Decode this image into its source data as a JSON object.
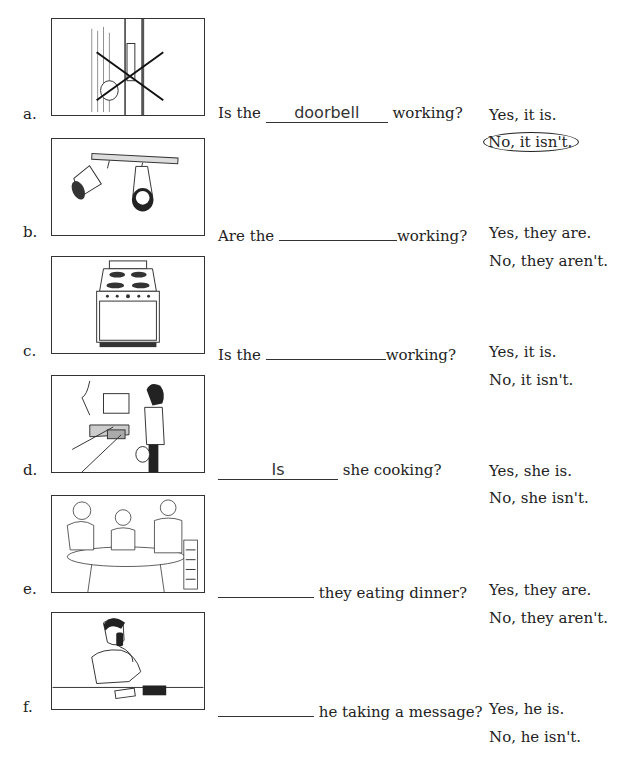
{
  "exercise": {
    "items": [
      {
        "letter": "a.",
        "picture": "doorbell-crossed-out-illustration",
        "question_prefix": "Is the",
        "blank_value": "doorbell",
        "question_suffix": "working?",
        "answer_yes": "Yes, it is.",
        "answer_no": "No, it isn't.",
        "circled": "no"
      },
      {
        "letter": "b.",
        "picture": "track-lights-illustration",
        "question_prefix": "Are the",
        "blank_value": "",
        "question_suffix": "working?",
        "answer_yes": "Yes, they are.",
        "answer_no": "No, they aren't."
      },
      {
        "letter": "c.",
        "picture": "stove-illustration",
        "question_prefix": "Is the",
        "blank_value": "",
        "question_suffix": "working?",
        "answer_yes": "Yes, it is.",
        "answer_no": "No, it isn't."
      },
      {
        "letter": "d.",
        "picture": "woman-cooking-illustration",
        "question_prefix": "",
        "blank_value": "Is",
        "question_suffix": "she cooking?",
        "answer_yes": "Yes, she is.",
        "answer_no": "No, she isn't."
      },
      {
        "letter": "e.",
        "picture": "family-dinner-illustration",
        "question_prefix": "",
        "blank_value": "",
        "question_suffix": "they eating dinner?",
        "answer_yes": "Yes, they are.",
        "answer_no": "No, they aren't."
      },
      {
        "letter": "f.",
        "picture": "man-on-phone-illustration",
        "question_prefix": "",
        "blank_value": "",
        "question_suffix": "he taking a message?",
        "answer_yes": "Yes, he is.",
        "answer_no": "No, he isn't."
      }
    ]
  }
}
